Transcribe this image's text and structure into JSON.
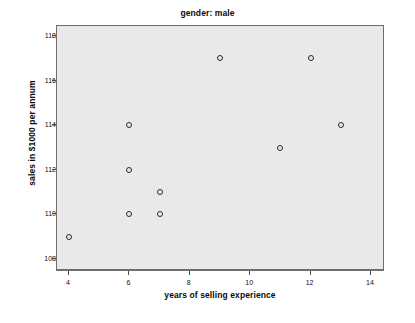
{
  "chart_data": {
    "type": "scatter",
    "title": "gender: male",
    "xlabel": "years of selling experience",
    "ylabel": "sales in $1000 per annum",
    "xlim": [
      3.6,
      14.4
    ],
    "ylim": [
      107.55,
      118.45
    ],
    "grid": false,
    "legend": null,
    "xticks": [
      4,
      6,
      8,
      10,
      12,
      14
    ],
    "yticks": [
      108,
      110,
      112,
      114,
      116,
      118
    ],
    "xtick_labels": [
      "4",
      "6",
      "8",
      "10",
      "12",
      "14"
    ],
    "ytick_labels": [
      "108",
      "110",
      "112",
      "114",
      "116",
      "118"
    ],
    "marker": "open-circle",
    "marker_color": "#2b2b2b",
    "plot_background": "#e9e9e9",
    "points": [
      {
        "x": 4,
        "y": 109
      },
      {
        "x": 6,
        "y": 110
      },
      {
        "x": 6,
        "y": 112
      },
      {
        "x": 6,
        "y": 114
      },
      {
        "x": 7,
        "y": 110
      },
      {
        "x": 7,
        "y": 111
      },
      {
        "x": 9,
        "y": 117
      },
      {
        "x": 11,
        "y": 113
      },
      {
        "x": 12,
        "y": 117
      },
      {
        "x": 13,
        "y": 114
      }
    ]
  }
}
